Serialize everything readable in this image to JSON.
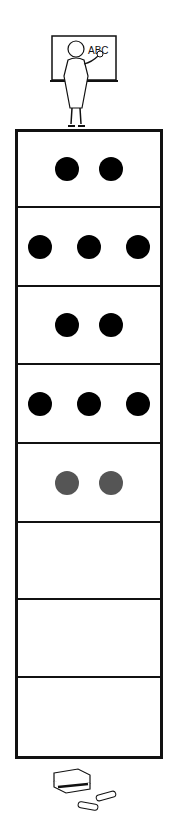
{
  "illustration": {
    "top": "teacher-at-chalkboard",
    "chalkboard_text": "ABC",
    "bottom": "eraser-and-chalk"
  },
  "ten_frame": {
    "rows": [
      {
        "dots": 2,
        "color": "#000000"
      },
      {
        "dots": 3,
        "color": "#000000"
      },
      {
        "dots": 2,
        "color": "#000000"
      },
      {
        "dots": 3,
        "color": "#000000"
      },
      {
        "dots": 2,
        "color": "#555555"
      },
      {
        "dots": 0
      },
      {
        "dots": 0
      },
      {
        "dots": 0
      }
    ]
  }
}
